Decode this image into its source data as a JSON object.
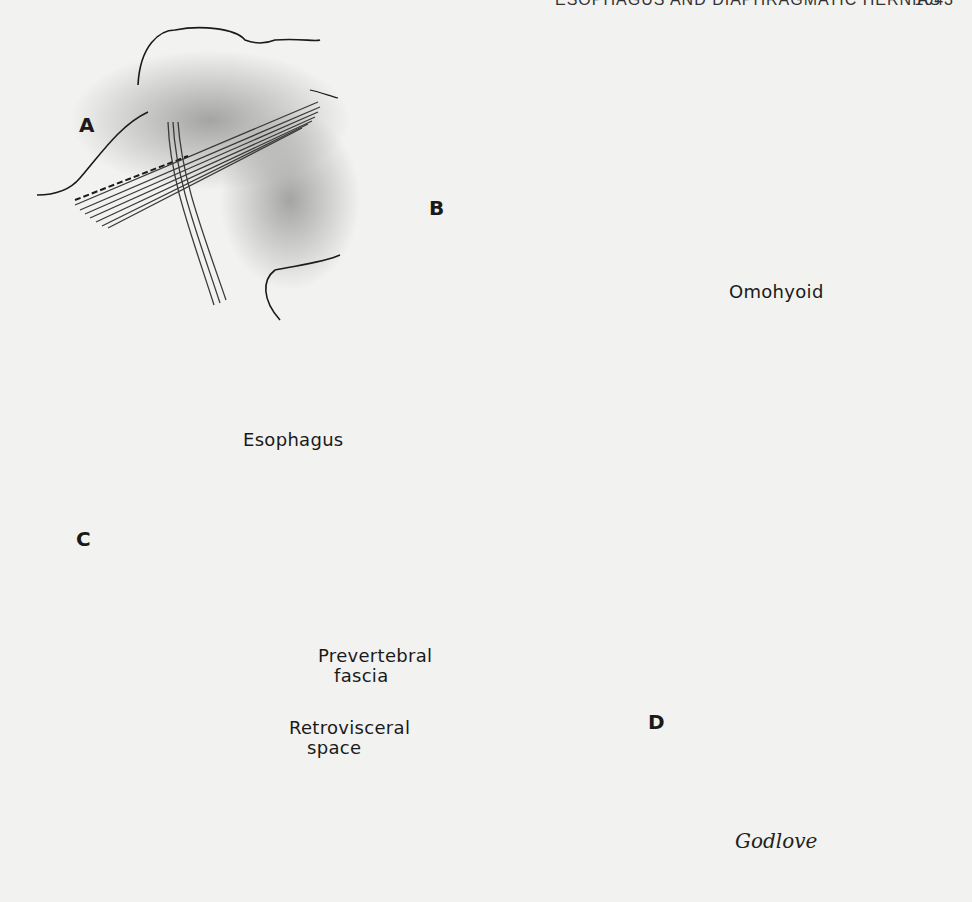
{
  "running_head": {
    "title": "ESOPHAGUS AND DIAPHRAGMATIC HERNIAS",
    "page_number": "1043"
  },
  "figure": {
    "panels": [
      {
        "id": "A",
        "label": "A"
      },
      {
        "id": "B",
        "label": "B"
      },
      {
        "id": "C",
        "label": "C"
      },
      {
        "id": "D",
        "label": "D"
      }
    ],
    "callouts": {
      "omohyoid": "Omohyoid",
      "esophagus": "Esophagus",
      "prevertebral_line1": "Prevertebral",
      "prevertebral_line2": "fascia",
      "retrovisceral_line1": "Retrovisceral",
      "retrovisceral_line2": "space"
    },
    "signature": "Godlove",
    "colors": {
      "paper": "#f2f2f0",
      "ink": "#1a1a1a",
      "shade": "#6e6e6e"
    }
  }
}
